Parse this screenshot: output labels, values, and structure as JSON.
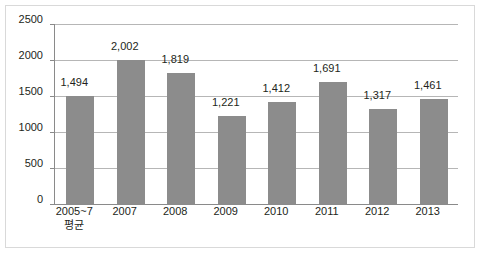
{
  "chart_data": {
    "type": "bar",
    "title": "",
    "subtitle": "",
    "xlabel": "",
    "ylabel": "",
    "categories": [
      "2005~7",
      "2007",
      "2008",
      "2009",
      "2010",
      "2011",
      "2012",
      "2013"
    ],
    "category_sublabels": [
      "평균",
      "",
      "",
      "",
      "",
      "",
      "",
      ""
    ],
    "values": [
      1494,
      2002,
      1819,
      1221,
      1412,
      1691,
      1317,
      1461
    ],
    "value_labels": [
      "1,494",
      "2,002",
      "1,819",
      "1,221",
      "1,412",
      "1,691",
      "1,317",
      "1,461"
    ],
    "ylim": [
      0,
      2500
    ],
    "yticks": [
      0,
      500,
      1000,
      1500,
      2000,
      2500
    ],
    "ytick_labels": [
      "0",
      "500",
      "1000",
      "1500",
      "2000",
      "2500"
    ],
    "grid": true,
    "legend": null,
    "series_color": "#8c8c8c",
    "gridline_color": "#b6b6b6",
    "axis_color": "#8a8a8a",
    "text_color": "#231f20",
    "background": "#ffffff"
  }
}
